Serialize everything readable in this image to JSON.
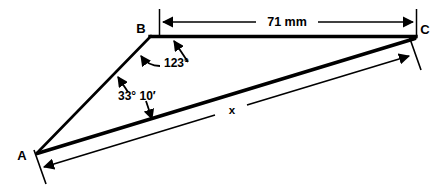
{
  "figure": {
    "type": "geometry-diagram",
    "background_color": "#ffffff",
    "stroke_color": "#000000"
  },
  "vertices": [
    {
      "name": "A",
      "label": "A",
      "x": 37,
      "y": 153,
      "label_x": 22,
      "label_y": 160
    },
    {
      "name": "B",
      "label": "B",
      "x": 150,
      "y": 36,
      "label_x": 140,
      "label_y": 33
    },
    {
      "name": "C",
      "label": "C",
      "x": 415,
      "y": 38,
      "label_x": 423,
      "label_y": 34
    }
  ],
  "sides": [
    {
      "name": "side-ab",
      "from": "A",
      "to": "B"
    },
    {
      "name": "side-bc",
      "from": "B",
      "to": "C"
    },
    {
      "name": "side-ac",
      "from": "A",
      "to": "C"
    }
  ],
  "dimensions": [
    {
      "name": "dimension-bc",
      "label": "71 mm",
      "value": 71,
      "unit": "mm",
      "measures": "BC",
      "label_x": 285,
      "label_y": 26,
      "orientation": "horizontal",
      "arrows": "both"
    },
    {
      "name": "dimension-ac",
      "label": "x",
      "value": null,
      "unit": "",
      "measures": "AC",
      "label_x": 233,
      "label_y": 113,
      "orientation": "oblique",
      "arrows": "both"
    }
  ],
  "angles": [
    {
      "name": "angle-b",
      "label": "123°",
      "degrees": 123,
      "minutes": 0,
      "at_vertex": "B",
      "label_x": 163,
      "label_y": 67
    },
    {
      "name": "angle-a",
      "label": "33° 10′",
      "degrees": 33,
      "minutes": 10,
      "at_vertex": "A",
      "label_x": 118,
      "label_y": 100
    }
  ]
}
